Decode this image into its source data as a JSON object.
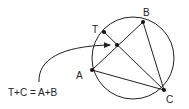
{
  "diagram": {
    "equation": "T+C = A+B",
    "points": {
      "T": {
        "label": "T",
        "x": 104,
        "y": 32
      },
      "B": {
        "label": "B",
        "x": 143,
        "y": 22
      },
      "A": {
        "label": "A",
        "x": 92,
        "y": 70
      },
      "C": {
        "label": "C",
        "x": 164,
        "y": 90
      },
      "X": {
        "label": "",
        "x": 117,
        "y": 45
      }
    },
    "circle": {
      "cx": 133,
      "cy": 58,
      "r": 41
    },
    "colors": {
      "stroke": "#222222",
      "background": "#ffffff"
    }
  }
}
